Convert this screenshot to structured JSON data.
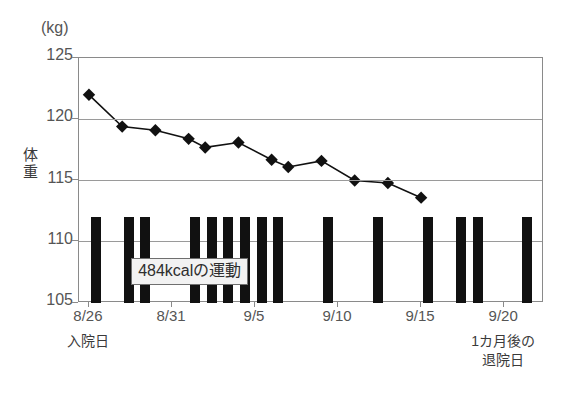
{
  "chart_data": {
    "type": "line",
    "title": "",
    "unit_label": "(kg)",
    "ylabel": "体重",
    "xlabel": "",
    "ylim": [
      105,
      125
    ],
    "yticks": [
      105,
      110,
      115,
      120,
      125
    ],
    "grid": true,
    "legend": false,
    "xticks": [
      "8/26",
      "8/31",
      "9/5",
      "9/10",
      "9/15",
      "9/20"
    ],
    "xtick_days": [
      0,
      5,
      10,
      15,
      20,
      25
    ],
    "x_days": [
      0,
      1,
      2,
      3,
      4,
      5,
      6,
      7,
      8,
      9,
      10,
      11,
      12,
      13,
      14,
      15,
      16,
      17,
      18,
      19,
      20,
      21,
      22,
      23,
      24,
      25,
      26,
      27
    ],
    "annotations": [
      {
        "name": "admission-caption",
        "text": "入院日",
        "x_day": 0
      },
      {
        "name": "discharge-caption",
        "text": "1カ月後の\n退院日",
        "line1": "1カ月後の",
        "line2": "退院日",
        "x_day": 25
      }
    ],
    "series": [
      {
        "name": "体重",
        "type": "line",
        "marker": "diamond",
        "color": "#111111",
        "points": [
          {
            "day": 0,
            "value": 122.0
          },
          {
            "day": 2,
            "value": 119.4
          },
          {
            "day": 4,
            "value": 119.1
          },
          {
            "day": 6,
            "value": 118.4
          },
          {
            "day": 7,
            "value": 117.7
          },
          {
            "day": 9,
            "value": 118.1
          },
          {
            "day": 11,
            "value": 116.7
          },
          {
            "day": 12,
            "value": 116.1
          },
          {
            "day": 14,
            "value": 116.6
          },
          {
            "day": 16,
            "value": 115.0
          },
          {
            "day": 18,
            "value": 114.8
          },
          {
            "day": 20,
            "value": 113.6
          }
        ]
      },
      {
        "name": "484kcalの運動",
        "type": "bar",
        "color": "#111111",
        "bar_top": 112.0,
        "bar_base": 105.0,
        "bar_days": [
          0.4,
          2.4,
          3.4,
          6.4,
          7.4,
          8.4,
          9.4,
          10.4,
          11.4,
          14.4,
          17.4,
          20.4,
          22.4,
          23.4,
          26.4
        ]
      }
    ],
    "callout": {
      "text": "484kcalの運動",
      "value_kcal": 484,
      "x_day": 2.6,
      "y_value": 108.6
    }
  }
}
